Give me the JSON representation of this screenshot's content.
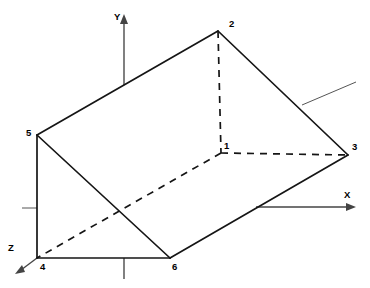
{
  "figure": {
    "type": "3d-wireframe-diagram",
    "width": 370,
    "height": 288,
    "background_color": "#ffffff",
    "line_color": "#151515",
    "axis_color": "#444444"
  },
  "vertices": [
    {
      "id": "v1",
      "label": "1",
      "x": 221,
      "y": 153,
      "hidden": true,
      "label_x": 224,
      "label_y": 141
    },
    {
      "id": "v2",
      "label": "2",
      "x": 218,
      "y": 31,
      "hidden": false,
      "label_x": 229,
      "label_y": 19
    },
    {
      "id": "v3",
      "label": "3",
      "x": 348,
      "y": 155,
      "hidden": false,
      "label_x": 352,
      "label_y": 142
    },
    {
      "id": "v4",
      "label": "4",
      "x": 37,
      "y": 258,
      "hidden": false,
      "label_x": 40,
      "label_y": 262
    },
    {
      "id": "v5",
      "label": "5",
      "x": 37,
      "y": 135,
      "hidden": false,
      "label_x": 26,
      "label_y": 128
    },
    {
      "id": "v6",
      "label": "6",
      "x": 170,
      "y": 258,
      "hidden": false,
      "label_x": 172,
      "label_y": 262
    }
  ],
  "edges": {
    "solid": [
      {
        "from": "v5",
        "to": "v2",
        "points": "37,135 218,31"
      },
      {
        "from": "v2",
        "to": "v3",
        "points": "218,31 348,155"
      },
      {
        "from": "v5",
        "to": "v4",
        "points": "37,135 37,258"
      },
      {
        "from": "v4",
        "to": "v6",
        "points": "37,258 170,258"
      },
      {
        "from": "v6",
        "to": "v3",
        "points": "170,258 348,155"
      },
      {
        "from": "v5",
        "to": "v6",
        "points": "37,135 170,258"
      }
    ],
    "dashed": [
      {
        "from": "v2",
        "to": "v1",
        "points": "218,31 221,153"
      },
      {
        "from": "v1",
        "to": "v3",
        "points": "221,153 348,155"
      },
      {
        "from": "v1",
        "to": "v4",
        "points": "221,153 37,258"
      }
    ]
  },
  "axes": [
    {
      "id": "axis-y",
      "label": "Y",
      "label_x": 114,
      "label_y": 12,
      "line": "124,18 124,85",
      "arrow": "124,14 120,24 128,24",
      "direction": "up"
    },
    {
      "id": "axis-x",
      "label": "X",
      "label_x": 344,
      "label_y": 190,
      "line": "256,207 350,207",
      "arrow": "356,207 346,203 346,211",
      "direction": "right"
    },
    {
      "id": "axis-z",
      "label": "Z",
      "label_x": 8,
      "label_y": 243,
      "line": "37,258 21,270",
      "arrow": "15,274 25,272 22,265",
      "direction": "down-left"
    }
  ],
  "axis_segments": [
    {
      "id": "y-axis-lower-stub",
      "points": "124,258 124,279"
    }
  ],
  "tick_marks": [
    {
      "id": "tick-left",
      "points": "22,208 37,208"
    }
  ],
  "leader_lines": [
    {
      "id": "leader-right",
      "points": "302,105 356,82"
    }
  ]
}
